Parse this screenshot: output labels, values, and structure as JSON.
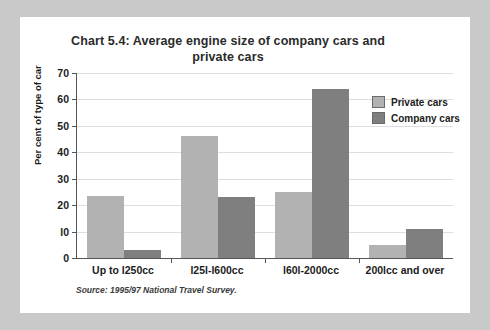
{
  "chart_data": {
    "type": "bar",
    "title": "Chart 5.4: Average engine size of company cars and private cars",
    "title_line1": "Chart 5.4: Average engine size of company cars and",
    "title_line2": "private cars",
    "xlabel": "",
    "ylabel": "Per cent of type of car",
    "ylim": [
      0,
      70
    ],
    "ytick_step": 10,
    "yticks": [
      0,
      10,
      20,
      30,
      40,
      50,
      60,
      70
    ],
    "ytick_labels": [
      "0",
      "l0",
      "20",
      "30",
      "40",
      "50",
      "60",
      "70"
    ],
    "grid": true,
    "legend_position": "top-right",
    "categories": [
      "Up to l250cc",
      "l25l-l600cc",
      "l60l-2000cc",
      "200lcc and over"
    ],
    "series": [
      {
        "name": "Private cars",
        "color": "#b2b2b2",
        "values": [
          23.5,
          46,
          25,
          5
        ]
      },
      {
        "name": "Company cars",
        "color": "#7f7f7f",
        "values": [
          3,
          23,
          64,
          11
        ]
      }
    ],
    "source": "Source: 1995/97 National Travel Survey.",
    "background": "#ffffff",
    "page_background": "#c9c9c9",
    "axis_color": "#555555",
    "gridline_color": "#dedede"
  }
}
